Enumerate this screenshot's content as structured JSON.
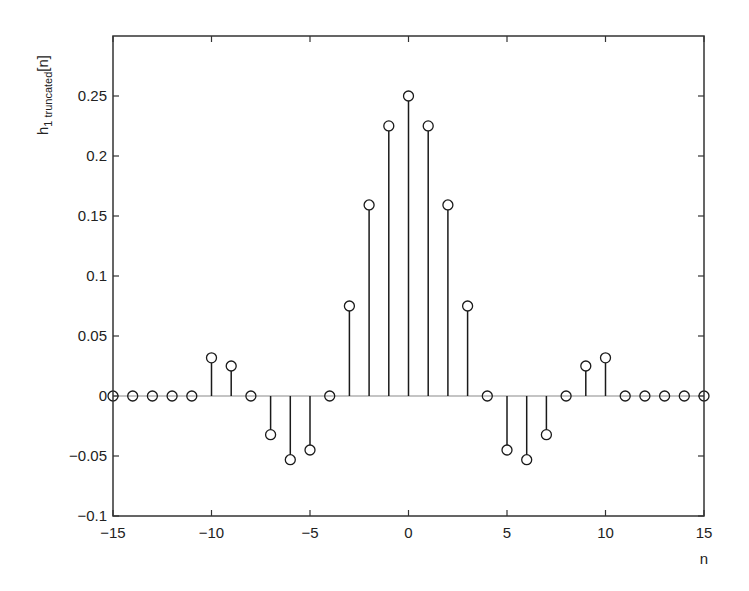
{
  "chart_data": {
    "type": "stem",
    "title": "",
    "xlabel": "n",
    "ylabel": "h1 truncated[n]",
    "ylabel_parts": {
      "base": "h",
      "subscript": "1 truncated",
      "suffix": "[n]"
    },
    "xlim": [
      -15,
      15
    ],
    "ylim": [
      -0.1,
      0.3
    ],
    "xticks": [
      -15,
      -10,
      -5,
      0,
      5,
      10,
      15
    ],
    "xtick_labels": [
      "−15",
      "−10",
      "−5",
      "0",
      "5",
      "10",
      "15"
    ],
    "yticks": [
      -0.1,
      -0.05,
      0,
      0.05,
      0.1,
      0.15,
      0.2,
      0.25
    ],
    "ytick_labels": [
      "−0.1",
      "−0.05",
      "0",
      "0.05",
      "0.1",
      "0.15",
      "0.2",
      "0.25"
    ],
    "grid": false,
    "legend": null,
    "marker": "open-circle",
    "baseline_color": "#b0b0b0",
    "stem_color": "#1a1a1a",
    "x": [
      -15,
      -14,
      -13,
      -12,
      -11,
      -10,
      -9,
      -8,
      -7,
      -6,
      -5,
      -4,
      -3,
      -2,
      -1,
      0,
      1,
      2,
      3,
      4,
      5,
      6,
      7,
      8,
      9,
      10,
      11,
      12,
      13,
      14,
      15
    ],
    "values": [
      0,
      0,
      0,
      0,
      0,
      0.0318,
      0.025,
      0,
      -0.0322,
      -0.0531,
      -0.045,
      0,
      0.075,
      0.1592,
      0.2251,
      0.25,
      0.2251,
      0.1592,
      0.075,
      0,
      -0.045,
      -0.0531,
      -0.0322,
      0,
      0.025,
      0.0318,
      0,
      0,
      0,
      0,
      0
    ]
  }
}
